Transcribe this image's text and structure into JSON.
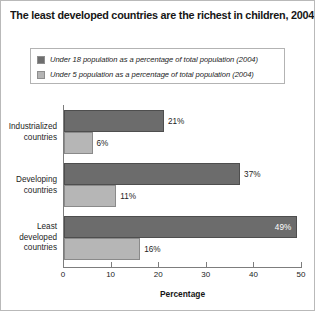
{
  "chart_data": {
    "type": "bar",
    "orientation": "horizontal",
    "title": "The least developed countries are the richest in children, 2004",
    "xlabel": "Percentage",
    "ylabel": "",
    "xlim": [
      0,
      50
    ],
    "xticks": [
      "0",
      "10",
      "20",
      "30",
      "40",
      "50"
    ],
    "grid": false,
    "legend_position": "top",
    "categories": [
      "Industrialized countries",
      "Developing countries",
      "Least developed countries"
    ],
    "category_lines": [
      [
        "Industrialized",
        "countries"
      ],
      [
        "Developing",
        "countries"
      ],
      [
        "Least",
        "developed",
        "countries"
      ]
    ],
    "series": [
      {
        "name": "Under 18 population as a percentage of total population (2004)",
        "color": "#6c6c6c",
        "values": [
          21,
          37,
          49
        ],
        "value_labels": [
          "21%",
          "37%",
          "49%"
        ],
        "label_placement": [
          "outside",
          "outside",
          "inside"
        ]
      },
      {
        "name": "Under 5 population as a percentage of total population (2004)",
        "color": "#b6b6b6",
        "values": [
          6,
          11,
          16
        ],
        "value_labels": [
          "6%",
          "11%",
          "16%"
        ],
        "label_placement": [
          "outside",
          "outside",
          "outside"
        ]
      }
    ]
  },
  "colors": {
    "series_dark": "#6c6c6c",
    "series_light": "#b6b6b6",
    "axis": "#7d7d7d",
    "text": "#1d1d1d",
    "border": "#b9b9b9"
  }
}
